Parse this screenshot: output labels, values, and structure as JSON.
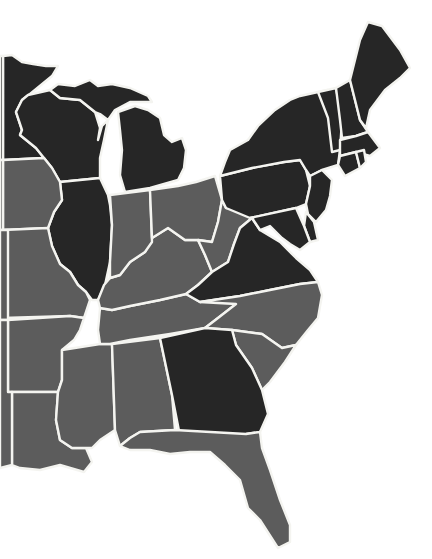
{
  "map": {
    "title": "Eastern United States",
    "colors": {
      "dark": "#262626",
      "medium": "#5c5c5c",
      "border": "#f4f4f0",
      "water": "#ffffff"
    },
    "states": [
      {
        "code": "MN",
        "name": "Minnesota",
        "category": "dark"
      },
      {
        "code": "WI",
        "name": "Wisconsin",
        "category": "dark"
      },
      {
        "code": "MI",
        "name": "Michigan",
        "category": "dark"
      },
      {
        "code": "MI-UP",
        "name": "Michigan Upper Peninsula",
        "category": "dark"
      },
      {
        "code": "IL",
        "name": "Illinois",
        "category": "dark"
      },
      {
        "code": "IA",
        "name": "Iowa",
        "category": "medium"
      },
      {
        "code": "MO",
        "name": "Missouri",
        "category": "medium"
      },
      {
        "code": "AR",
        "name": "Arkansas",
        "category": "medium"
      },
      {
        "code": "LA",
        "name": "Louisiana",
        "category": "medium"
      },
      {
        "code": "MS",
        "name": "Mississippi",
        "category": "medium"
      },
      {
        "code": "AL",
        "name": "Alabama",
        "category": "medium"
      },
      {
        "code": "TN",
        "name": "Tennessee",
        "category": "medium"
      },
      {
        "code": "KY",
        "name": "Kentucky",
        "category": "medium"
      },
      {
        "code": "IN",
        "name": "Indiana",
        "category": "medium"
      },
      {
        "code": "OH",
        "name": "Ohio",
        "category": "medium"
      },
      {
        "code": "WV",
        "name": "West Virginia",
        "category": "medium"
      },
      {
        "code": "VA",
        "name": "Virginia",
        "category": "dark"
      },
      {
        "code": "NC",
        "name": "North Carolina",
        "category": "medium"
      },
      {
        "code": "SC",
        "name": "South Carolina",
        "category": "medium"
      },
      {
        "code": "GA",
        "name": "Georgia",
        "category": "dark"
      },
      {
        "code": "FL",
        "name": "Florida",
        "category": "medium"
      },
      {
        "code": "PA",
        "name": "Pennsylvania",
        "category": "dark"
      },
      {
        "code": "NY",
        "name": "New York",
        "category": "dark"
      },
      {
        "code": "NJ",
        "name": "New Jersey",
        "category": "dark"
      },
      {
        "code": "DE",
        "name": "Delaware",
        "category": "dark"
      },
      {
        "code": "MD",
        "name": "Maryland",
        "category": "dark"
      },
      {
        "code": "VT",
        "name": "Vermont",
        "category": "dark"
      },
      {
        "code": "NH",
        "name": "New Hampshire",
        "category": "dark"
      },
      {
        "code": "ME",
        "name": "Maine",
        "category": "dark"
      },
      {
        "code": "MA",
        "name": "Massachusetts",
        "category": "dark"
      },
      {
        "code": "CT",
        "name": "Connecticut",
        "category": "dark"
      },
      {
        "code": "RI",
        "name": "Rhode Island",
        "category": "dark"
      },
      {
        "code": "W1",
        "name": "Western state (partial)",
        "category": "dark"
      },
      {
        "code": "W2",
        "name": "Western state (partial)",
        "category": "medium"
      },
      {
        "code": "W3",
        "name": "Western state (partial)",
        "category": "medium"
      },
      {
        "code": "W4",
        "name": "Western state (partial)",
        "category": "medium"
      },
      {
        "code": "W5",
        "name": "Western state (partial)",
        "category": "medium"
      }
    ]
  }
}
